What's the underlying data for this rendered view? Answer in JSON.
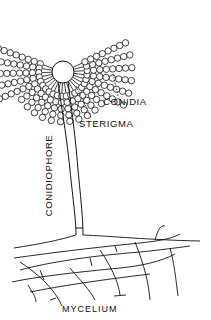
{
  "diagram": {
    "labels": {
      "conidia": "CONIDIA",
      "sterigma": "STERIGMA",
      "conidiophore": "CONIDIOPHORE",
      "mycelium": "MYCELIUM"
    },
    "colors": {
      "ink": "#111111",
      "background": "#ffffff"
    },
    "vesicle": {
      "cx": 63,
      "cy": 72,
      "r": 11
    },
    "chains": {
      "count": 22,
      "angle_start_deg": 160,
      "angle_end_deg": 385,
      "conidia_per_chain": 8,
      "conidium_radius": 3.2
    }
  }
}
